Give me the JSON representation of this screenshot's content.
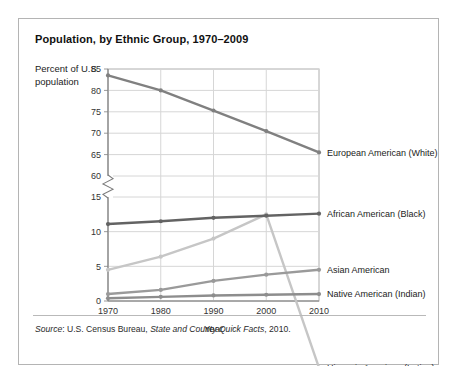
{
  "card": {
    "title": "Population, by Ethnic Group, 1970–2009",
    "y_axis_caption": "Percent of U.S. population",
    "source_prefix": "Source",
    "source_sep": ": ",
    "source_agency": "U.S. Census Bureau, ",
    "source_publication": "State and County Quick Facts",
    "source_year": ", 2010."
  },
  "chart_data": {
    "type": "line",
    "title": "Population, by Ethnic Group, 1970–2009",
    "xlabel": "Year",
    "ylabel": "Percent of U.S. population",
    "x": [
      1970,
      1980,
      1990,
      2000,
      2010
    ],
    "xtick_labels": [
      "1970",
      "1980",
      "1990",
      "2000",
      "2010"
    ],
    "ytick_labels": [
      "0",
      "5",
      "10",
      "15",
      "60",
      "65",
      "70",
      "75",
      "80",
      "85"
    ],
    "ytick_values": [
      0,
      5,
      10,
      15,
      60,
      65,
      70,
      75,
      80,
      85
    ],
    "axis_break": true,
    "axis_break_between": [
      15,
      60
    ],
    "ylim_lower": [
      0,
      17
    ],
    "ylim_upper": [
      58,
      85
    ],
    "grid": true,
    "legend_position": "right-inline",
    "series": [
      {
        "name": "European American (White)",
        "color": "#808080",
        "values": [
          83.5,
          80.0,
          75.3,
          70.5,
          65.5
        ],
        "label_y": 65.5
      },
      {
        "name": "Hispanic American (Latino)",
        "color": "#c6c6c6",
        "values": [
          4.5,
          6.4,
          9.0,
          12.5,
          15.2
        ],
        "label_y": 15.2
      },
      {
        "name": "African American (Black)",
        "color": "#636363",
        "values": [
          11.1,
          11.5,
          12.0,
          12.3,
          12.6
        ],
        "label_y": 12.6
      },
      {
        "name": "Asian American",
        "color": "#9a9a9a",
        "values": [
          1.0,
          1.6,
          2.9,
          3.8,
          4.5
        ],
        "label_y": 4.5
      },
      {
        "name": "Native American (Indian)",
        "color": "#8d8d8d",
        "values": [
          0.4,
          0.6,
          0.8,
          0.9,
          1.0
        ],
        "label_y": 1.0
      }
    ]
  }
}
